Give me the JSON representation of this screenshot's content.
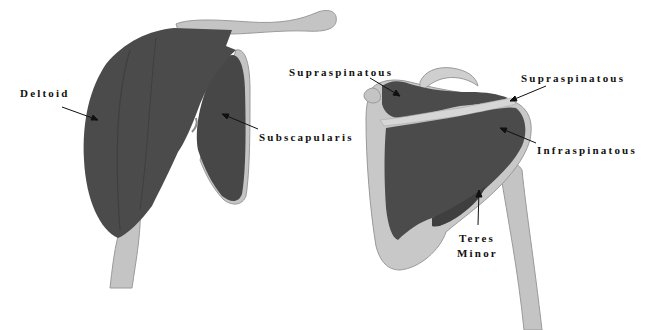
{
  "diagram": {
    "type": "anatomical-illustration",
    "colors": {
      "muscle": "#4b4b4b",
      "muscle_shadow": "#3c3c3c",
      "bone": "#c4c4c4",
      "bone_highlight": "#dedede",
      "bone_edge": "#9a9a9a",
      "label_text": "#111111",
      "arrow": "#111111",
      "background": "#ffffff"
    },
    "views": [
      {
        "name": "anterior-view",
        "labels": [
          {
            "text": "Deltoid",
            "x": 20,
            "y": 86
          },
          {
            "text": "Subscapularis",
            "x": 259,
            "y": 130
          }
        ]
      },
      {
        "name": "posterior-view",
        "labels": [
          {
            "text": "Supraspinatous",
            "x": 289,
            "y": 65
          },
          {
            "text": "Supraspinatous",
            "x": 521,
            "y": 71
          },
          {
            "text": "Infraspinatous",
            "x": 537,
            "y": 143
          },
          {
            "text": "Teres",
            "x": 459,
            "y": 231
          },
          {
            "text": "Minor",
            "x": 457,
            "y": 246
          }
        ]
      }
    ]
  }
}
